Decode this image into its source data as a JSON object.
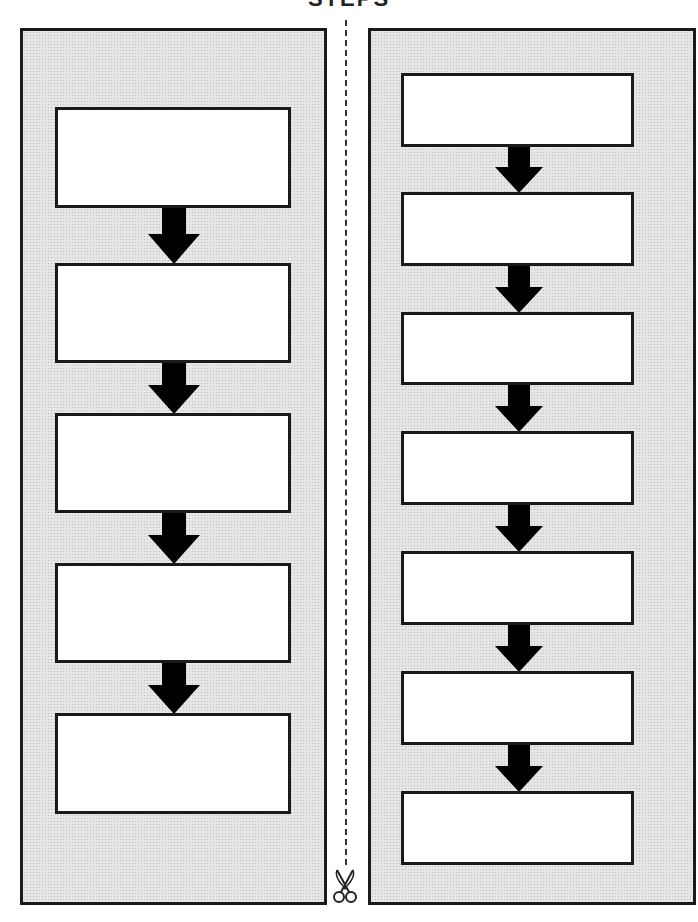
{
  "title": "STEPS",
  "left_panel": {
    "box_count": 5,
    "boxes": [
      "",
      "",
      "",
      "",
      ""
    ]
  },
  "right_panel": {
    "box_count": 7,
    "boxes": [
      "",
      "",
      "",
      "",
      "",
      "",
      ""
    ]
  },
  "icons": {
    "cut_line": "dashed-cut-line",
    "scissors": "scissors-icon",
    "arrow": "down-arrow-icon"
  },
  "colors": {
    "panel_fill": "#e6e6e6",
    "border": "#1a1a1a",
    "box_fill": "#ffffff",
    "arrow": "#000000"
  }
}
